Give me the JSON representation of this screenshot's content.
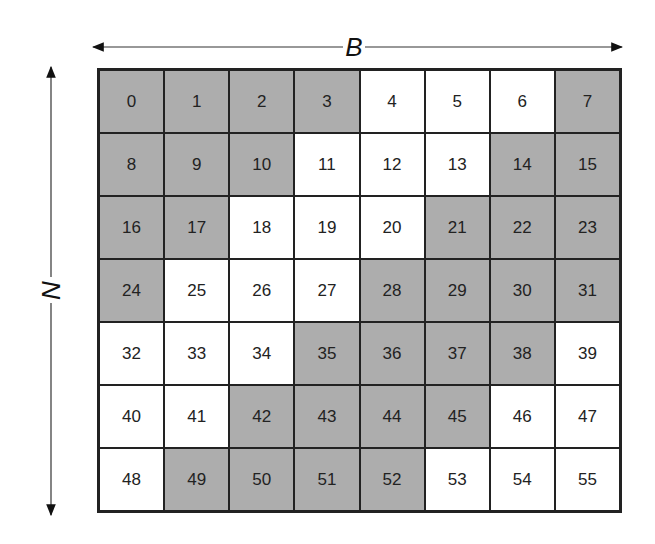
{
  "labels": {
    "horizontal": "B",
    "vertical": "N"
  },
  "colors": {
    "shaded": "#adadad",
    "unshaded": "#ffffff",
    "border": "#222222"
  },
  "grid": {
    "rows": 7,
    "cols": 8,
    "cells": [
      {
        "n": "0",
        "s": 1
      },
      {
        "n": "1",
        "s": 1
      },
      {
        "n": "2",
        "s": 1
      },
      {
        "n": "3",
        "s": 1
      },
      {
        "n": "4",
        "s": 0
      },
      {
        "n": "5",
        "s": 0
      },
      {
        "n": "6",
        "s": 0
      },
      {
        "n": "7",
        "s": 1
      },
      {
        "n": "8",
        "s": 1
      },
      {
        "n": "9",
        "s": 1
      },
      {
        "n": "10",
        "s": 1
      },
      {
        "n": "11",
        "s": 0
      },
      {
        "n": "12",
        "s": 0
      },
      {
        "n": "13",
        "s": 0
      },
      {
        "n": "14",
        "s": 1
      },
      {
        "n": "15",
        "s": 1
      },
      {
        "n": "16",
        "s": 1
      },
      {
        "n": "17",
        "s": 1
      },
      {
        "n": "18",
        "s": 0
      },
      {
        "n": "19",
        "s": 0
      },
      {
        "n": "20",
        "s": 0
      },
      {
        "n": "21",
        "s": 1
      },
      {
        "n": "22",
        "s": 1
      },
      {
        "n": "23",
        "s": 1
      },
      {
        "n": "24",
        "s": 1
      },
      {
        "n": "25",
        "s": 0
      },
      {
        "n": "26",
        "s": 0
      },
      {
        "n": "27",
        "s": 0
      },
      {
        "n": "28",
        "s": 1
      },
      {
        "n": "29",
        "s": 1
      },
      {
        "n": "30",
        "s": 1
      },
      {
        "n": "31",
        "s": 1
      },
      {
        "n": "32",
        "s": 0
      },
      {
        "n": "33",
        "s": 0
      },
      {
        "n": "34",
        "s": 0
      },
      {
        "n": "35",
        "s": 1
      },
      {
        "n": "36",
        "s": 1
      },
      {
        "n": "37",
        "s": 1
      },
      {
        "n": "38",
        "s": 1
      },
      {
        "n": "39",
        "s": 0
      },
      {
        "n": "40",
        "s": 0
      },
      {
        "n": "41",
        "s": 0
      },
      {
        "n": "42",
        "s": 1
      },
      {
        "n": "43",
        "s": 1
      },
      {
        "n": "44",
        "s": 1
      },
      {
        "n": "45",
        "s": 1
      },
      {
        "n": "46",
        "s": 0
      },
      {
        "n": "47",
        "s": 0
      },
      {
        "n": "48",
        "s": 0
      },
      {
        "n": "49",
        "s": 1
      },
      {
        "n": "50",
        "s": 1
      },
      {
        "n": "51",
        "s": 1
      },
      {
        "n": "52",
        "s": 1
      },
      {
        "n": "53",
        "s": 0
      },
      {
        "n": "54",
        "s": 0
      },
      {
        "n": "55",
        "s": 0
      }
    ]
  }
}
